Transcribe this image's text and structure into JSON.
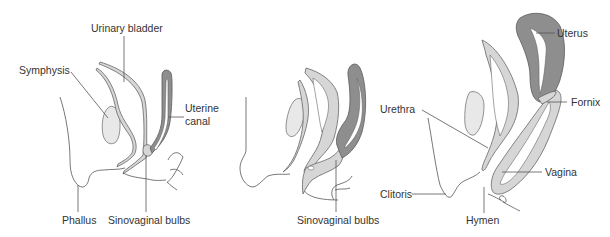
{
  "figure": {
    "panels": [
      {
        "id": "panel-1",
        "labels": {
          "urinary_bladder": "Urinary bladder",
          "symphysis": "Symphysis",
          "uterine_canal_line1": "Uterine",
          "uterine_canal_line2": "canal",
          "phallus": "Phallus",
          "sinovaginal_bulbs": "Sinovaginal bulbs"
        }
      },
      {
        "id": "panel-2",
        "labels": {
          "sinovaginal_bulbs": "Sinovaginal bulbs"
        }
      },
      {
        "id": "panel-3",
        "labels": {
          "uterus": "Uterus",
          "urethra": "Urethra",
          "fornix": "Fornix",
          "vagina": "Vagina",
          "clitoris": "Clitoris",
          "hymen": "Hymen"
        }
      }
    ],
    "colors": {
      "symphysis_fill": "#e8e8e8",
      "light_wall": "#d6d6d6",
      "dark_wall": "#8e8e8e",
      "outline": "#555555",
      "text": "#333333"
    }
  }
}
